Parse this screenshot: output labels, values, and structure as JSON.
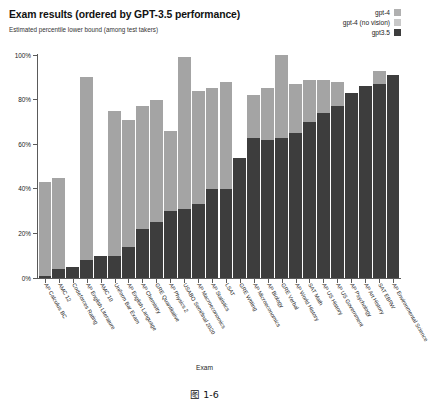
{
  "chart_data": {
    "type": "bar",
    "title": "Exam results (ordered by GPT-3.5 performance)",
    "subtitle": "Estimated percentile lower bound (among test takers)",
    "xlabel": "Exam",
    "ylabel": "",
    "ylim": [
      0,
      100
    ],
    "grid": false,
    "legend_position": "top-right",
    "ytick_labels": [
      "100%",
      "80%",
      "60%",
      "40%",
      "20%",
      "0%"
    ],
    "ytick_values": [
      100,
      80,
      60,
      40,
      20,
      0
    ],
    "categories": [
      "AP Calculus BC",
      "AMC 12",
      "Codeforces Rating",
      "AP English Literature",
      "AMC 10",
      "Uniform Bar Exam",
      "AP English Language",
      "AP Chemistry",
      "GRE Quantitative",
      "AP Physics 2",
      "USABO Semifinal 2020",
      "AP Macroeconomics",
      "AP Statistics",
      "LSAT",
      "GRE Writing",
      "AP Microeconomics",
      "AP Biology",
      "GRE Verbal",
      "AP World History",
      "SAT Math",
      "AP US History",
      "AP US Government",
      "AP Psychology",
      "AP Art History",
      "SAT EBRW",
      "AP Environmental Science"
    ],
    "series": [
      {
        "name": "gpt-4",
        "color": "#b0b0b0",
        "values": [
          43,
          45,
          5,
          90,
          10,
          75,
          71,
          77,
          80,
          66,
          99,
          84,
          85,
          88,
          54,
          82,
          85,
          100,
          87,
          89,
          89,
          88,
          83,
          86,
          93,
          91
        ]
      },
      {
        "name": "gpt-4 (no vision)",
        "color": "#9a9a9a",
        "values": [
          43,
          45,
          5,
          90,
          10,
          75,
          71,
          77,
          80,
          66,
          99,
          84,
          85,
          88,
          54,
          82,
          85,
          100,
          87,
          89,
          89,
          88,
          83,
          86,
          93,
          91
        ]
      },
      {
        "name": "gpt3.5",
        "color": "#3d3d3d",
        "values": [
          1,
          4,
          5,
          8,
          10,
          10,
          14,
          22,
          25,
          30,
          31,
          33,
          40,
          40,
          54,
          63,
          62,
          63,
          65,
          70,
          74,
          77,
          83,
          86,
          87,
          91
        ]
      }
    ]
  },
  "legend": {
    "items": [
      {
        "label": "gpt-4",
        "color": "#b0b0b0"
      },
      {
        "label": "gpt-4 (no vision)",
        "color": "#c8c8c8"
      },
      {
        "label": "gpt3.5",
        "color": "#3d3d3d"
      }
    ]
  },
  "caption": "图 1-6"
}
